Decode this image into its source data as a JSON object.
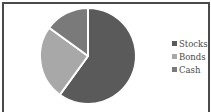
{
  "chart_data": {
    "type": "pie",
    "title": "",
    "categories": [
      "Stocks",
      "Bonds",
      "Cash"
    ],
    "values": [
      60,
      25,
      15
    ],
    "colors": [
      "#5a5a5a",
      "#a8a8a8",
      "#7a7a7a"
    ],
    "start_angle": "12 o'clock",
    "direction": "clockwise",
    "legend_position": "right",
    "legend": [
      {
        "label": "Stocks",
        "color": "#5a5a5a"
      },
      {
        "label": "Bonds",
        "color": "#a8a8a8"
      },
      {
        "label": "Cash",
        "color": "#7a7a7a"
      }
    ]
  },
  "colors": {
    "frame": "#4a4a4a",
    "separator": "#ffffff",
    "text": "#4a4a4a"
  }
}
